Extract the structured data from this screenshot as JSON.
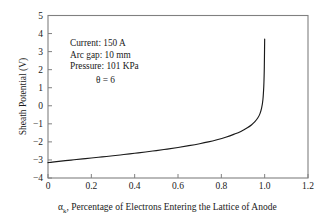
{
  "chart_data": {
    "type": "line",
    "title": "",
    "xlabel": "αₖ, Percentage of Electrons Entering the Lattice of Anode",
    "xlabel_symbol": "α",
    "xlabel_subscript": "k",
    "xlabel_rest": ", Percentage of Electrons Entering the Lattice of Anode",
    "ylabel": "Sheath Potential (V)",
    "xlim": [
      0,
      1.2
    ],
    "ylim": [
      -4,
      5
    ],
    "xticks": [
      "0",
      "0.2",
      "0.4",
      "0.6",
      "0.8",
      "1.0",
      "1.2"
    ],
    "xtick_values": [
      0,
      0.2,
      0.4,
      0.6,
      0.8,
      1.0,
      1.2
    ],
    "yticks": [
      "5",
      "4",
      "3",
      "2",
      "1",
      "0",
      "−1",
      "−2",
      "−3",
      "−4"
    ],
    "ytick_values": [
      5,
      4,
      3,
      2,
      1,
      0,
      -1,
      -2,
      -3,
      -4
    ],
    "grid": false,
    "legend": null,
    "series": [
      {
        "name": "Sheath Potential",
        "color": "#1a1a1a",
        "x": [
          0.0,
          0.02,
          0.05,
          0.08,
          0.12,
          0.16,
          0.2,
          0.25,
          0.3,
          0.35,
          0.4,
          0.45,
          0.5,
          0.55,
          0.6,
          0.65,
          0.7,
          0.74,
          0.78,
          0.82,
          0.86,
          0.89,
          0.92,
          0.94,
          0.955,
          0.968,
          0.978,
          0.986,
          0.992,
          0.996,
          0.998,
          0.999,
          1.0
        ],
        "y": [
          -3.15,
          -3.12,
          -3.08,
          -3.04,
          -2.99,
          -2.94,
          -2.89,
          -2.83,
          -2.77,
          -2.7,
          -2.63,
          -2.56,
          -2.48,
          -2.4,
          -2.31,
          -2.21,
          -2.1,
          -2.0,
          -1.88,
          -1.74,
          -1.57,
          -1.42,
          -1.22,
          -1.05,
          -0.88,
          -0.68,
          -0.45,
          -0.12,
          0.35,
          1.1,
          1.9,
          2.7,
          3.7
        ]
      }
    ],
    "annotations": [
      {
        "text": "Current: 150 A",
        "x": 0.18,
        "y": 4.05
      },
      {
        "text": "Arc gap: 10 mm",
        "x": 0.18,
        "y": 3.45
      },
      {
        "text": "Pressure: 101 KPa",
        "x": 0.18,
        "y": 2.85
      },
      {
        "text": "θ = 6",
        "x": 0.31,
        "y": 2.05
      }
    ]
  },
  "axes": {
    "y_axis_title": "Sheath Potential (V)",
    "x_axis_title_prefix": "α",
    "x_axis_title_sub": "k",
    "x_axis_title_suffix": ", Percentage of Electrons Entering the Lattice of Anode"
  },
  "annotations": {
    "line1": "Current: 150 A",
    "line2": "Arc gap: 10 mm",
    "line3": "Pressure: 101 KPa",
    "line4": "θ = 6"
  },
  "colors": {
    "curve": "#1a1a1a",
    "frame": "#808080",
    "text": "#1a1a1a",
    "background": "#ffffff"
  }
}
